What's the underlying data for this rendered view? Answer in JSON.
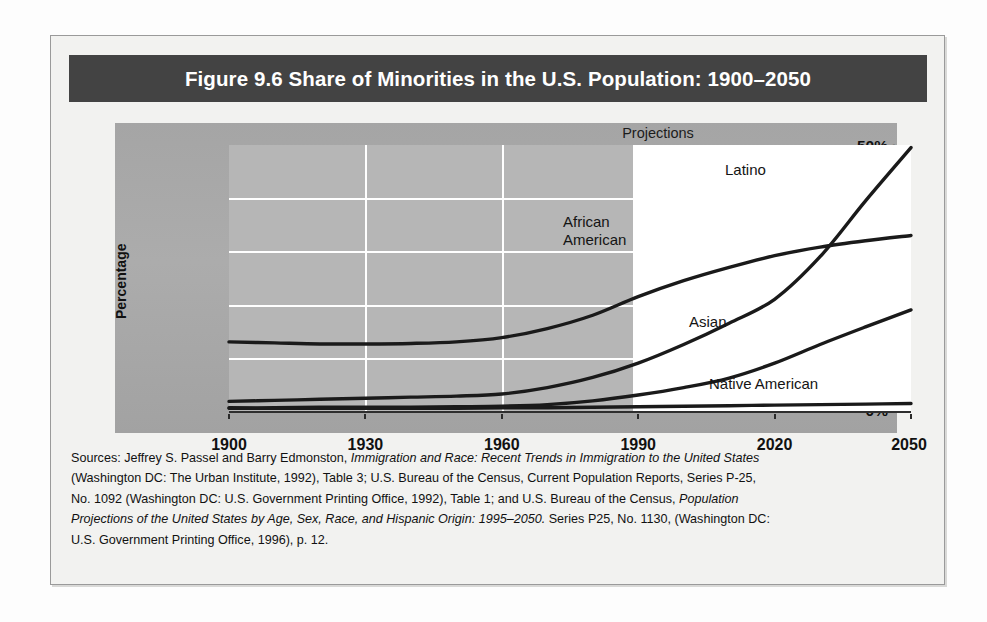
{
  "figure": {
    "title": "Figure 9.6  Share of Minorities in the U.S. Population: 1900–2050",
    "projections_label": "Projections"
  },
  "axes": {
    "y_title": "Percentage",
    "y_ticks": [
      "50%",
      "40%",
      "30%",
      "20%",
      "10%",
      "0%"
    ],
    "x_ticks": [
      "1900",
      "1930",
      "1960",
      "1990",
      "2020",
      "2050"
    ]
  },
  "series_labels": {
    "latino": "Latino",
    "african_american_line1": "African",
    "african_american_line2": "American",
    "asian": "Asian",
    "native_american": "Native American"
  },
  "colors": {
    "title_bar": "#434343",
    "title_text": "#ffffff",
    "panel_gray": "#a8a8a8",
    "plot_historical": "#b6b6b6",
    "plot_projection": "#ffffff",
    "gridline": "#ffffff",
    "line": "#1a1a1a",
    "frame_background": "#f2f2f0"
  },
  "sources": {
    "line1_a": "Sources: Jeffrey S. Passel and Barry Edmonston, ",
    "line1_ital": "Immigration and Race: Recent Trends in Immigration to the United States",
    "line2": "(Washington DC: The Urban Institute, 1992), Table 3; U.S. Bureau of the Census, Current Population Reports, Series P-25,",
    "line3_a": "No. 1092 (Washington DC: U.S. Government Printing Office, 1992), Table 1; and U.S. Bureau of the Census, ",
    "line3_ital": "Population",
    "line4_ital": "Projections of the United States by Age, Sex, Race, and Hispanic Origin: 1995–2050.",
    "line4_b": " Series P25, No. 1130, (Washington DC:",
    "line5": "U.S. Government Printing Office, 1996), p. 12."
  },
  "chart_data": {
    "type": "line",
    "title": "Figure 9.6  Share of Minorities in the U.S. Population: 1900–2050",
    "xlabel": "",
    "ylabel": "Percentage",
    "xlim": [
      1900,
      2050
    ],
    "ylim": [
      0,
      50
    ],
    "y_tick_values": [
      0,
      10,
      20,
      30,
      40,
      50
    ],
    "x_tick_values": [
      1900,
      1930,
      1960,
      1990,
      2020,
      2050
    ],
    "grid": true,
    "legend": "inline-labels",
    "annotations": [
      {
        "text": "Projections",
        "x_from": 1990,
        "x_to": 2050,
        "note": "white shaded region marks projected years"
      }
    ],
    "x": [
      1900,
      1910,
      1920,
      1930,
      1940,
      1950,
      1960,
      1970,
      1980,
      1990,
      2000,
      2010,
      2020,
      2030,
      2040,
      2050
    ],
    "series": [
      {
        "name": "African American",
        "values": [
          13.0,
          12.8,
          12.6,
          12.6,
          12.7,
          13.0,
          13.8,
          15.5,
          18.0,
          21.5,
          24.5,
          27.0,
          29.2,
          30.8,
          32.0,
          33.0
        ]
      },
      {
        "name": "Latino",
        "values": [
          1.8,
          2.0,
          2.2,
          2.4,
          2.6,
          2.8,
          3.2,
          4.4,
          6.3,
          9.0,
          12.5,
          16.5,
          21.0,
          29.0,
          39.5,
          49.5
        ]
      },
      {
        "name": "Asian",
        "values": [
          0.6,
          0.6,
          0.7,
          0.7,
          0.7,
          0.8,
          0.9,
          1.2,
          1.9,
          3.0,
          4.4,
          6.2,
          9.0,
          12.5,
          15.8,
          19.0
        ]
      },
      {
        "name": "Native American",
        "values": [
          0.5,
          0.5,
          0.5,
          0.5,
          0.5,
          0.5,
          0.6,
          0.6,
          0.7,
          0.8,
          0.9,
          1.0,
          1.1,
          1.2,
          1.3,
          1.4
        ]
      }
    ]
  }
}
